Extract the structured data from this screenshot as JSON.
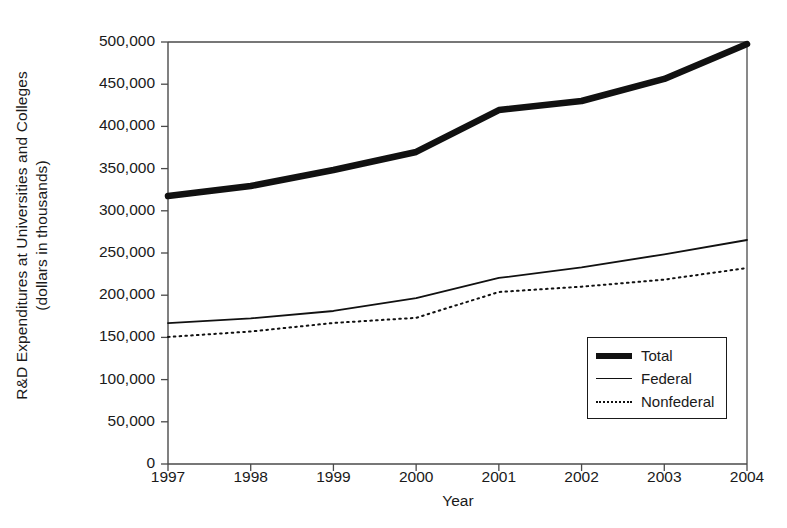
{
  "chart_data": {
    "type": "line",
    "title": "",
    "xlabel": "Year",
    "ylabel": "R&D Expenditures at Universities and Colleges (dollars in thousands)",
    "ylabel_line1": "R&D Expenditures at Universities and Colleges",
    "ylabel_line2": "(dollars in thousands)",
    "categories": [
      "1997",
      "1998",
      "1999",
      "2000",
      "2001",
      "2002",
      "2003",
      "2004"
    ],
    "x": [
      1997,
      1998,
      1999,
      2000,
      2001,
      2002,
      2003,
      2004
    ],
    "xlim": [
      1997,
      2004
    ],
    "ylim": [
      0,
      500000
    ],
    "ytick_values": [
      0,
      50000,
      100000,
      150000,
      200000,
      250000,
      300000,
      350000,
      400000,
      450000,
      500000
    ],
    "ytick_labels": [
      "0",
      "50,000",
      "100,000",
      "150,000",
      "200,000",
      "250,000",
      "300,000",
      "350,000",
      "400,000",
      "450,000",
      "500,000"
    ],
    "grid": false,
    "legend_position": "inside-lower-right",
    "series": [
      {
        "name": "Total",
        "style": "thick-solid",
        "color": "#111111",
        "values": [
          317500,
          329400,
          348300,
          369700,
          419400,
          430100,
          456200,
          497600
        ]
      },
      {
        "name": "Federal",
        "style": "thin-solid",
        "color": "#111111",
        "values": [
          167000,
          172500,
          181300,
          196500,
          220400,
          233000,
          248500,
          265400
        ]
      },
      {
        "name": "Nonfederal",
        "style": "dotted",
        "color": "#111111",
        "values": [
          150500,
          157000,
          167100,
          173200,
          203800,
          210100,
          218500,
          232200
        ]
      }
    ]
  },
  "legend": {
    "items": [
      {
        "label": "Total",
        "swatch": "thick-solid-line-swatch"
      },
      {
        "label": "Federal",
        "swatch": "thin-solid-line-swatch"
      },
      {
        "label": "Nonfederal",
        "swatch": "dotted-line-swatch"
      }
    ]
  }
}
